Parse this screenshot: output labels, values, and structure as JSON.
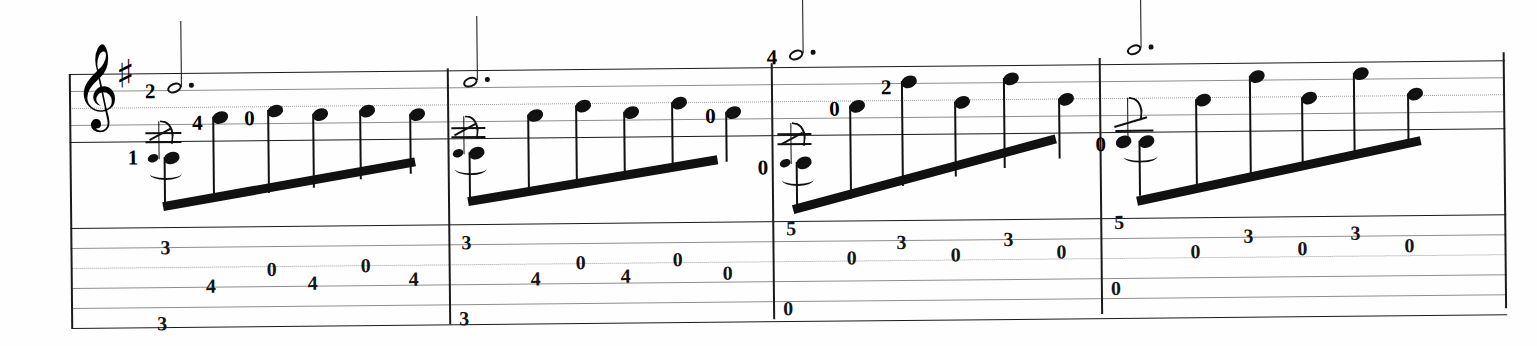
{
  "document": {
    "kind": "guitar-score",
    "title": "",
    "notation": "standard-notation-with-tablature",
    "clef": "treble-clef",
    "clef_glyph": "𝄞",
    "key_signature": "one-sharp",
    "sharp_glyph": "♯",
    "measure_count": 4,
    "staff_lines_standard": 5,
    "staff_lines_tab": 6,
    "ink_color": "#111111",
    "staff_color": "#1b1b1b",
    "paper_color": "#fefefe"
  },
  "measures": [
    {
      "number": "1",
      "upper_voice": {
        "fingering": "2",
        "note_value": "dotted-half",
        "dot": "·"
      },
      "grace_note": {
        "fingering": "1",
        "type": "acciaccatura",
        "slur": true
      },
      "melody_fingerings": [
        "4",
        "0"
      ],
      "tab": [
        {
          "string": "2",
          "fret": "3"
        },
        {
          "string": "4",
          "fret": "4"
        },
        {
          "string": "3",
          "fret": "0"
        },
        {
          "string": "4",
          "fret": "4"
        },
        {
          "string": "3",
          "fret": "0"
        },
        {
          "string": "4",
          "fret": "4"
        },
        {
          "string": "6",
          "fret": "3"
        }
      ],
      "tab_labels": [
        "3",
        "4",
        "0",
        "4",
        "0",
        "4",
        "3"
      ]
    },
    {
      "number": "2",
      "upper_voice": {
        "fingering": "",
        "note_value": "dotted-half",
        "dot": "·"
      },
      "grace_note": {
        "fingering": "",
        "type": "acciaccatura",
        "slur": true
      },
      "melody_fingerings": [
        "0"
      ],
      "tab": [
        {
          "string": "2",
          "fret": "3"
        },
        {
          "string": "4",
          "fret": "4"
        },
        {
          "string": "3",
          "fret": "0"
        },
        {
          "string": "4",
          "fret": "4"
        },
        {
          "string": "3",
          "fret": "0"
        },
        {
          "string": "4",
          "fret": "0"
        },
        {
          "string": "6",
          "fret": "3"
        }
      ],
      "tab_labels": [
        "3",
        "4",
        "0",
        "4",
        "0",
        "0",
        "3"
      ]
    },
    {
      "number": "3",
      "upper_voice": {
        "fingering": "4",
        "note_value": "dotted-half",
        "dot": "·"
      },
      "grace_note": {
        "fingering": "0",
        "type": "acciaccatura",
        "slur": true
      },
      "melody_fingerings": [
        "0",
        "2"
      ],
      "tab": [
        {
          "string": "2",
          "fret": "5"
        },
        {
          "string": "3",
          "fret": "0"
        },
        {
          "string": "2",
          "fret": "3"
        },
        {
          "string": "3",
          "fret": "0"
        },
        {
          "string": "2",
          "fret": "3"
        },
        {
          "string": "3",
          "fret": "0"
        },
        {
          "string": "6",
          "fret": "0"
        }
      ],
      "tab_labels": [
        "5",
        "0",
        "3",
        "0",
        "3",
        "0",
        "0"
      ]
    },
    {
      "number": "4",
      "upper_voice": {
        "fingering": "",
        "note_value": "dotted-half",
        "dot": "·"
      },
      "grace_note": {
        "fingering": "0",
        "type": "acciaccatura",
        "slur": true
      },
      "melody_fingerings": [],
      "tab": [
        {
          "string": "2",
          "fret": "5"
        },
        {
          "string": "3",
          "fret": "0"
        },
        {
          "string": "2",
          "fret": "3"
        },
        {
          "string": "3",
          "fret": "0"
        },
        {
          "string": "2",
          "fret": "3"
        },
        {
          "string": "3",
          "fret": "0"
        },
        {
          "string": "5",
          "fret": "0"
        }
      ],
      "tab_labels": [
        "5",
        "0",
        "3",
        "0",
        "3",
        "0",
        "0"
      ]
    }
  ]
}
